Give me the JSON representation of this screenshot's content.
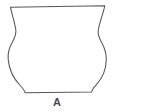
{
  "figure": {
    "kind": "archaeological-vessel-profile-line-drawing",
    "label": "A",
    "subject_name": "globular jar with everted rim",
    "background_color": "#ffffff",
    "outline_color": "#555555",
    "fill_color": "#ffffff",
    "outline_width_px": 1.05,
    "label_color": "#4a4a4a"
  },
  "drawing": {
    "canvas": {
      "width": 154,
      "height": 112
    },
    "description": "Symmetrical profile silhouette of a ceramic pot: wide flaring everted rim at top, short constricted neck, rounded globular shoulder and body, narrowing to a flat base.",
    "outline_path": "M 10.5 7.2 L 104.8 5.8 C 103.0 14.0 99.6 22.0 98.3 30.0 C 97.4 35.4 99.6 39.0 102.0 43.2 C 105.0 48.6 106.4 53.8 106.3 59.5 C 106.1 69.0 102.6 78.0 96.4 84.6 C 94.2 87.0 92.0 89.6 91.6 92.1 L 25.2 92.8 C 24.6 90.2 22.2 87.6 19.8 85.0 C 13.4 78.2 9.1 69.2 8.2 59.6 C 7.6 53.6 9.0 48.2 12.0 42.8 C 14.4 38.4 16.6 34.8 15.8 29.6 C 14.6 21.8 11.9 14.6 10.5 7.2 Z",
    "feature_points": {
      "rim_left": {
        "x": 10.5,
        "y": 7.2
      },
      "rim_right": {
        "x": 104.8,
        "y": 5.8
      },
      "neck_waist_left": {
        "x": 15.2,
        "y": 33.5
      },
      "neck_waist_right": {
        "x": 98.2,
        "y": 32.5
      },
      "max_body_width_left": {
        "x": 6.6,
        "y": 59.0
      },
      "max_body_width_right": {
        "x": 106.3,
        "y": 59.5
      },
      "base_left": {
        "x": 25.2,
        "y": 92.8
      },
      "base_right": {
        "x": 91.6,
        "y": 92.1
      }
    },
    "measurements_px": {
      "rim_width": 94,
      "neck_width": 83,
      "max_body_width": 100,
      "base_width": 66,
      "total_height": 87
    }
  }
}
